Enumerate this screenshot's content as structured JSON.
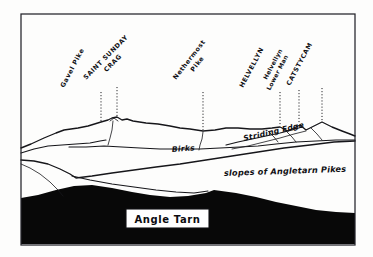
{
  "figure": {
    "kind": "hand-drawn-fell-panorama-sketch",
    "frame": {
      "x": 21,
      "y": 14,
      "width": 334,
      "height": 231
    }
  },
  "colors": {
    "ink": "#16161a",
    "paper": "#fdfdfc",
    "tarn_silhouette": "#080808",
    "frame": "#23232a"
  },
  "peak_labels": [
    {
      "id": "gavel-pike",
      "text": "Gavel Pike",
      "text2": "",
      "angle": -62,
      "tx": 64,
      "ty": 88,
      "leader_x": 101,
      "leader_y1": 92,
      "leader_y2": 122
    },
    {
      "id": "saint-sunday-crag",
      "text": "SAINT SUNDAY",
      "text2": "CRAG",
      "angle": -45,
      "tx": 88,
      "ty": 76,
      "leader_x": 117,
      "leader_y1": 87,
      "leader_y2": 118
    },
    {
      "id": "nethermost-pike",
      "text": "Nethermost",
      "text2": "Pike",
      "angle": -52,
      "tx": 176,
      "ty": 78,
      "leader_x": 203,
      "leader_y1": 92,
      "leader_y2": 131
    },
    {
      "id": "helvellyn",
      "text": "HELVELLYN",
      "text2": "",
      "angle": -62,
      "tx": 243,
      "ty": 88,
      "leader_x": 280,
      "leader_y1": 92,
      "leader_y2": 128
    },
    {
      "id": "helvellyn-lower-man",
      "text": "Helvellyn",
      "text2": "Lower Man",
      "angle": -62,
      "tx": 266,
      "ty": 84,
      "leader_x": 299,
      "leader_y1": 90,
      "leader_y2": 125
    },
    {
      "id": "catstycam",
      "text": "CATSTYCAM",
      "text2": "",
      "angle": -62,
      "tx": 292,
      "ty": 84,
      "leader_x": 322,
      "leader_y1": 88,
      "leader_y2": 122
    }
  ],
  "ridge_labels": [
    {
      "id": "striding-edge",
      "text": "Striding Edge",
      "x": 244,
      "y": 141,
      "angle": -13
    },
    {
      "id": "birks",
      "text": "Birks",
      "x": 172,
      "y": 152,
      "angle": -4
    }
  ],
  "slope_labels": [
    {
      "id": "angletarn-pikes-slopes",
      "text": "slopes of  Angletarn Pikes",
      "x": 224,
      "y": 176,
      "angle": -2
    }
  ],
  "tarn_box": {
    "label": "Angle Tarn",
    "x": 126,
    "y": 209,
    "width": 83,
    "height": 19
  }
}
